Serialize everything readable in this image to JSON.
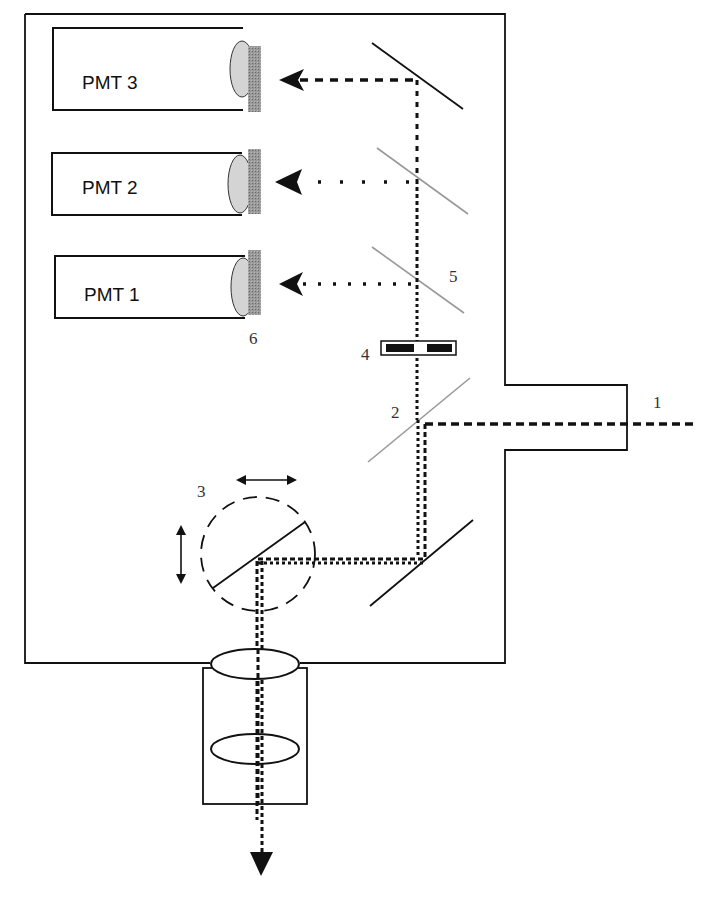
{
  "diagram": {
    "type": "optical-schematic",
    "detectors": [
      {
        "id": "pmt3",
        "label": "PMT 3"
      },
      {
        "id": "pmt2",
        "label": "PMT 2"
      },
      {
        "id": "pmt1",
        "label": "PMT 1"
      }
    ],
    "numbered_labels": {
      "n1": "1",
      "n2": "2",
      "n3": "3",
      "n4": "4",
      "n5": "5",
      "n6": "6"
    },
    "colors": {
      "stroke": "#111111",
      "dichroic": "#999999",
      "filter": "#8a8a8a",
      "pmt_window": "#d4d4d4"
    }
  }
}
